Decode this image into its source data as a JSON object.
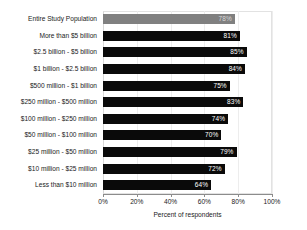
{
  "chart_data": {
    "type": "bar",
    "orientation": "horizontal",
    "title": "",
    "xlabel": "Percent of respondents",
    "ylabel": "",
    "xlim": [
      0,
      100
    ],
    "xticks": [
      "0%",
      "20%",
      "40%",
      "60%",
      "80%",
      "100%"
    ],
    "xtick_values": [
      0,
      20,
      40,
      60,
      80,
      100
    ],
    "grid": true,
    "legend": "none",
    "categories": [
      "Entire Study Population",
      "More than $5 billion",
      "$2.5 billion - $5 billion",
      "$1 billion - $2.5 billion",
      "$500 million - $1 billion",
      "$250 million - $500 million",
      "$100 million - $250 million",
      "$50 million - $100 million",
      "$25 million - $50 million",
      "$10 million - $25 million",
      "Less than $10 million"
    ],
    "values": [
      78,
      81,
      85,
      84,
      75,
      83,
      74,
      70,
      79,
      72,
      64
    ],
    "value_labels": [
      "78%",
      "81%",
      "85%",
      "84%",
      "75%",
      "83%",
      "74%",
      "70%",
      "79%",
      "72%",
      "64%"
    ],
    "bar_colors": [
      "#808080",
      "#0a0a0a",
      "#0a0a0a",
      "#0a0a0a",
      "#0a0a0a",
      "#0a0a0a",
      "#0a0a0a",
      "#0a0a0a",
      "#0a0a0a",
      "#0a0a0a",
      "#0a0a0a"
    ],
    "highlight_index": 0,
    "value_label_color": "#ffffff",
    "axis_color": "#8c8c8c",
    "grid_color": "#ededed",
    "background": "#ffffff"
  }
}
